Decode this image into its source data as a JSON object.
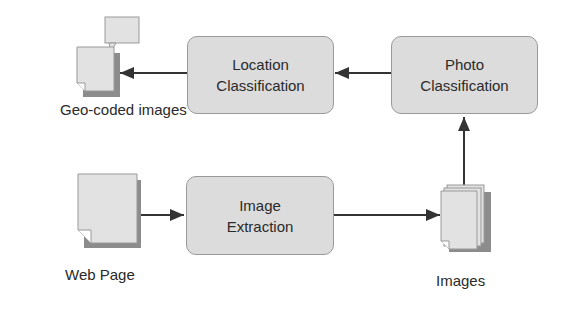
{
  "nodes": {
    "location_classification": {
      "line1": "Location",
      "line2": "Classification"
    },
    "photo_classification": {
      "line1": "Photo",
      "line2": "Classification"
    },
    "image_extraction": {
      "line1": "Image",
      "line2": "Extraction"
    }
  },
  "labels": {
    "geo_coded": "Geo-coded images",
    "web_page": "Web Page",
    "images": "Images"
  },
  "colors": {
    "box_fill": "#dcdcdc",
    "box_border": "#9a9a9a",
    "doc_fill": "#e2e2e2",
    "doc_shadow": "#8c8c8c",
    "arrow": "#333333"
  }
}
